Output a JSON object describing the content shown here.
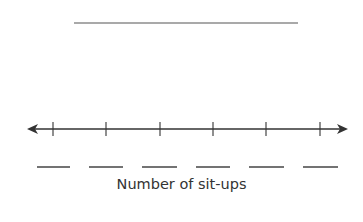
{
  "title_blank": {
    "x1": 74,
    "x2": 298,
    "y": 23
  },
  "number_line": {
    "y": 129,
    "x_start": 27,
    "x_end": 348,
    "ticks_x": [
      53,
      106,
      160,
      213,
      266,
      320
    ],
    "answer_blanks": [
      [
        37,
        70
      ],
      [
        89,
        123
      ],
      [
        142,
        177
      ],
      [
        196,
        230
      ],
      [
        249,
        284
      ],
      [
        303,
        338
      ]
    ],
    "blank_y": 167,
    "axis_label": "Number of sit-ups"
  },
  "colors": {
    "line": "#333333",
    "blank": "#444444"
  }
}
